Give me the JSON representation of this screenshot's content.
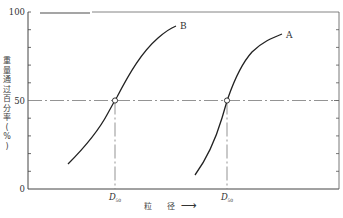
{
  "chart_data": {
    "type": "line",
    "title": "",
    "xlabel": "粒 径",
    "xlabel_arrow": "⟶",
    "ylabel": "重量通过百分率 (%)",
    "ylim": [
      0,
      100
    ],
    "yticks": [
      0,
      50,
      100
    ],
    "ytick_labels": [
      "0",
      "50",
      "100"
    ],
    "minor_ytick_step": 10,
    "grid": false,
    "legend": null,
    "reference_line_y": 50,
    "series": [
      {
        "name": "B",
        "label": "B",
        "d50_label": "D50",
        "points_relative": [
          [
            0.0,
            14
          ],
          [
            0.1,
            30
          ],
          [
            0.19,
            50
          ],
          [
            0.3,
            75
          ],
          [
            0.4,
            88
          ],
          [
            0.45,
            93
          ]
        ],
        "d50_x_relative": 0.19
      },
      {
        "name": "A",
        "label": "A",
        "d50_label": "D50",
        "points_relative": [
          [
            0.54,
            9
          ],
          [
            0.62,
            30
          ],
          [
            0.69,
            50
          ],
          [
            0.78,
            72
          ],
          [
            0.88,
            86
          ],
          [
            0.92,
            88
          ]
        ],
        "d50_x_relative": 0.69
      }
    ],
    "annotations": [
      {
        "text": "D50",
        "at": "x of curve B at 50%"
      },
      {
        "text": "D50",
        "at": "x of curve A at 50%"
      }
    ]
  },
  "labels": {
    "y100": "100",
    "y50": "50",
    "y0": "0",
    "curveB": "B",
    "curveA": "A",
    "d50_main": "D",
    "d50_sub": "50",
    "ylabel": "重量通过百分率 (%)",
    "xlabel": "粒 径",
    "xarrow": "⟶"
  }
}
